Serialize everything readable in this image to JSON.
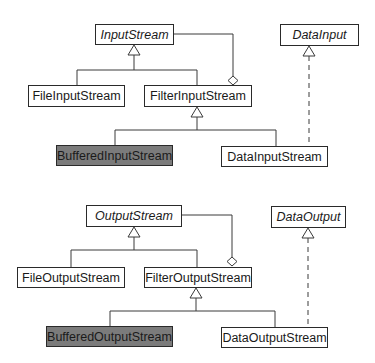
{
  "diagram": {
    "type": "uml-class-diagram",
    "colors": {
      "box_fill": "#ffffff",
      "highlight_fill": "#7b7b7b",
      "stroke": "#2a2a2a"
    },
    "input": {
      "input_stream": {
        "label": "InputStream",
        "abstract": true
      },
      "data_input": {
        "label": "DataInput",
        "interface": true
      },
      "file_input_stream": {
        "label": "FileInputStream"
      },
      "filter_input_stream": {
        "label": "FilterInputStream"
      },
      "buffered_input_stream": {
        "label": "BufferedInputStream",
        "highlighted": true
      },
      "data_input_stream": {
        "label": "DataInputStream"
      }
    },
    "output": {
      "output_stream": {
        "label": "OutputStream",
        "abstract": true
      },
      "data_output": {
        "label": "DataOutput",
        "interface": true
      },
      "file_output_stream": {
        "label": "FileOutputStream"
      },
      "filter_output_stream": {
        "label": "FilterOutputStream"
      },
      "buffered_output_stream": {
        "label": "BufferedOutputStream",
        "highlighted": true
      },
      "data_output_stream": {
        "label": "DataOutputStream"
      }
    },
    "relationships": [
      {
        "from": "FileInputStream",
        "to": "InputStream",
        "kind": "inheritance"
      },
      {
        "from": "FilterInputStream",
        "to": "InputStream",
        "kind": "inheritance"
      },
      {
        "from": "FilterInputStream",
        "to": "InputStream",
        "kind": "aggregation"
      },
      {
        "from": "BufferedInputStream",
        "to": "FilterInputStream",
        "kind": "inheritance"
      },
      {
        "from": "DataInputStream",
        "to": "FilterInputStream",
        "kind": "inheritance"
      },
      {
        "from": "DataInputStream",
        "to": "DataInput",
        "kind": "realization"
      },
      {
        "from": "FileOutputStream",
        "to": "OutputStream",
        "kind": "inheritance"
      },
      {
        "from": "FilterOutputStream",
        "to": "OutputStream",
        "kind": "inheritance"
      },
      {
        "from": "FilterOutputStream",
        "to": "OutputStream",
        "kind": "aggregation"
      },
      {
        "from": "BufferedOutputStream",
        "to": "FilterOutputStream",
        "kind": "inheritance"
      },
      {
        "from": "DataOutputStream",
        "to": "FilterOutputStream",
        "kind": "inheritance"
      },
      {
        "from": "DataOutputStream",
        "to": "DataOutput",
        "kind": "realization"
      }
    ]
  }
}
